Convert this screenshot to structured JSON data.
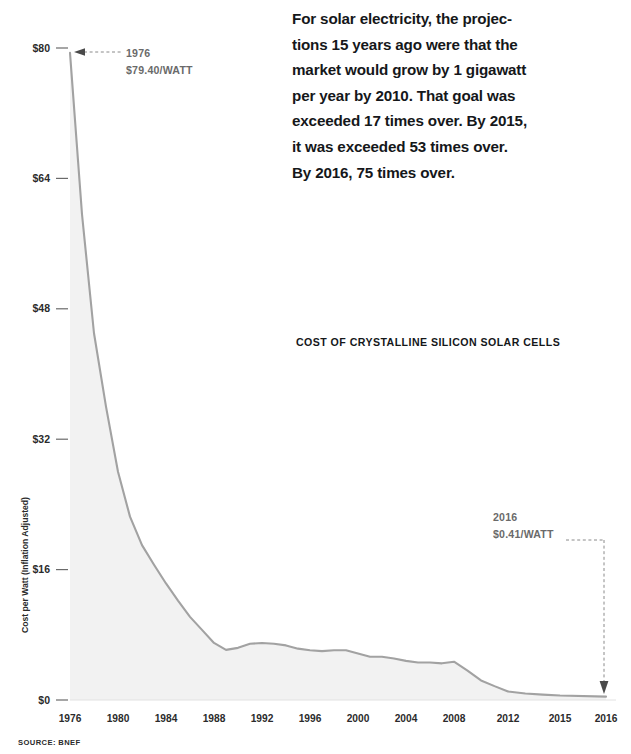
{
  "narrative": {
    "lines": [
      "For solar electricity, the projec-",
      "tions 15 years ago were that the",
      "market would grow by 1 gigawatt",
      "per year by 2010. That goal was",
      "exceeded 17 times over. By 2015,",
      "it was exceeded 53 times over.",
      "By 2016, 75 times over."
    ]
  },
  "source": "SOURCE: BNEF",
  "annotations": {
    "start": {
      "year": "1976",
      "value": "$79.40/WATT"
    },
    "end": {
      "year": "2016",
      "value": "$0.41/WATT"
    }
  },
  "chart_data": {
    "type": "area",
    "title": "COST OF CRYSTALLINE SILICON SOLAR CELLS",
    "xlabel": "",
    "ylabel": "Cost per Watt (Inflation Adjusted)",
    "ylim": [
      0,
      80
    ],
    "yticks": [
      0,
      16,
      32,
      48,
      64,
      80
    ],
    "ytick_labels": [
      "$0",
      "$16",
      "$32",
      "$48",
      "$64",
      "$80"
    ],
    "xticks": [
      1976,
      1980,
      1984,
      1988,
      1992,
      1996,
      2000,
      2004,
      2008,
      2012,
      2015,
      2016
    ],
    "xtick_labels": [
      "1976",
      "1980",
      "1984",
      "1988",
      "1992",
      "1996",
      "2000",
      "2004",
      "2008",
      "2012",
      "2015",
      "2016"
    ],
    "grid": false,
    "legend": false,
    "line_color": "#a2a2a2",
    "fill_color": "#f2f2f2",
    "series": [
      {
        "name": "Cost per Watt (Inflation Adjusted)",
        "x": [
          1976,
          1977,
          1978,
          1979,
          1980,
          1981,
          1982,
          1983,
          1984,
          1985,
          1986,
          1987,
          1988,
          1989,
          1990,
          1991,
          1992,
          1993,
          1994,
          1995,
          1996,
          1997,
          1998,
          1999,
          2000,
          2001,
          2002,
          2003,
          2004,
          2005,
          2006,
          2007,
          2008,
          2009,
          2010,
          2011,
          2012,
          2013,
          2014,
          2015,
          2016
        ],
        "values": [
          79.4,
          59.6,
          45.0,
          36.0,
          28.0,
          22.5,
          19.0,
          16.6,
          14.3,
          12.2,
          10.2,
          8.6,
          7.0,
          6.15,
          6.4,
          6.9,
          7.0,
          6.9,
          6.7,
          6.3,
          6.1,
          6.0,
          6.1,
          6.1,
          5.7,
          5.3,
          5.3,
          5.1,
          4.8,
          4.6,
          4.6,
          4.5,
          4.7,
          3.6,
          2.4,
          1.7,
          1.05,
          0.8,
          0.66,
          0.55,
          0.41
        ]
      }
    ]
  }
}
